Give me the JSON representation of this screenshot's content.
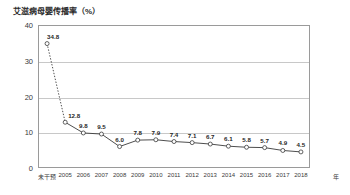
{
  "chart_data": {
    "type": "line",
    "title": "艾滋病母婴传播率（%）",
    "xlabel": "年",
    "ylabel": "",
    "ylim": [
      0,
      40
    ],
    "yticks": [
      0,
      10,
      20,
      30,
      40
    ],
    "ytick_labels": [
      "0",
      "10",
      "20",
      "30",
      "40"
    ],
    "grid": true,
    "gridlines_at": [
      10,
      20,
      30
    ],
    "legend": "none",
    "categories": [
      "未干预",
      "2005",
      "2006",
      "2007",
      "2008",
      "2009",
      "2010",
      "2011",
      "2012",
      "2013",
      "2014",
      "2015",
      "2016",
      "2017",
      "2018"
    ],
    "values": [
      34.8,
      12.8,
      9.8,
      9.5,
      6.0,
      7.8,
      7.9,
      7.4,
      7.1,
      6.7,
      6.1,
      5.8,
      5.7,
      4.9,
      4.5
    ],
    "point_labels": [
      "34.8",
      "12.8",
      "9.8",
      "9.5",
      "6.0",
      "7.8",
      "7.9",
      "7.4",
      "7.1",
      "6.7",
      "6.1",
      "5.8",
      "5.7",
      "4.9",
      "4.5"
    ],
    "series_style": {
      "line_color": "#3a3a3a",
      "marker_face": "#ffffff",
      "marker_edge": "#3a3a3a",
      "dashed_segment_from_index": 0,
      "dashed_segment_to_index": 1
    },
    "colors": {
      "frame": "#9a9a9a",
      "grid": "#c8c8c8",
      "text": "#2b2b2b",
      "background": "#ffffff"
    }
  }
}
